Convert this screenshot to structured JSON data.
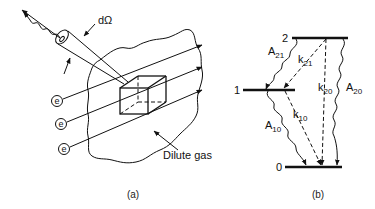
{
  "panel_a": {
    "caption": "(a)",
    "solid_angle_label": "dΩ",
    "electron_label": "e",
    "electron_count": 3,
    "gas_label": "Dilute gas"
  },
  "panel_b": {
    "caption": "(b)",
    "levels": [
      {
        "id": "level-2",
        "label": "2"
      },
      {
        "id": "level-1",
        "label": "1"
      },
      {
        "id": "level-0",
        "label": "0"
      }
    ],
    "transitions": [
      {
        "id": "A21",
        "base": "A",
        "sub": "21",
        "kind": "radiative"
      },
      {
        "id": "k21",
        "base": "k",
        "sub": "21",
        "kind": "collisional"
      },
      {
        "id": "k20",
        "base": "k",
        "sub": "20",
        "kind": "collisional"
      },
      {
        "id": "A20",
        "base": "A",
        "sub": "20",
        "kind": "radiative"
      },
      {
        "id": "A10",
        "base": "A",
        "sub": "10",
        "kind": "radiative"
      },
      {
        "id": "k10",
        "base": "k",
        "sub": "10",
        "kind": "collisional"
      }
    ]
  }
}
